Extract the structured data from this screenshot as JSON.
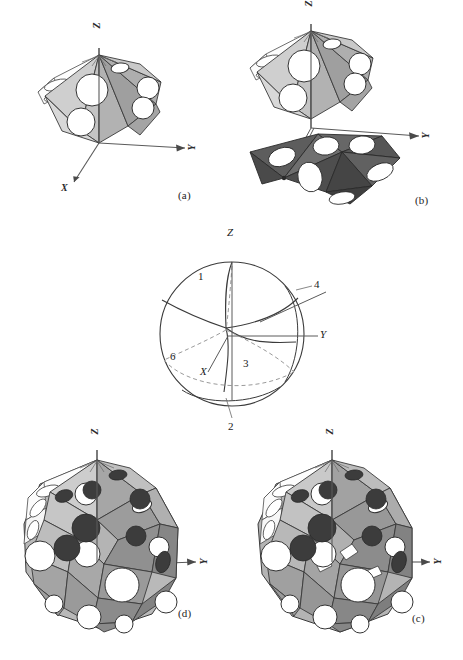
{
  "figure": {
    "type": "scientific-illustration",
    "background_color": "#ffffff",
    "panels": [
      {
        "id": "a",
        "caption": "(a)",
        "description": "single light-gray polyhedral cap cluster with circular pores",
        "axes": [
          {
            "name": "z-axis",
            "label": "Z",
            "direction": "up"
          },
          {
            "name": "y-axis",
            "label": "Y",
            "direction": "right"
          },
          {
            "name": "x-axis",
            "label": "X",
            "direction": "lower-left"
          }
        ]
      },
      {
        "id": "b",
        "caption": "(b)",
        "description": "two polyhedral cap clusters, upper light-gray and lower dark-gray, joined along the z axis",
        "axes": [
          {
            "name": "z-axis",
            "label": "Z",
            "direction": "up"
          },
          {
            "name": "y-axis",
            "label": "Y",
            "direction": "right"
          }
        ]
      },
      {
        "id": "d",
        "caption": "(d)",
        "description": "closed quasi-spherical polyhedron assembled from cap clusters, circular pores on facets",
        "axes": [
          {
            "name": "z-axis",
            "label": "Z",
            "direction": "up"
          },
          {
            "name": "y-axis",
            "label": "Y",
            "direction": "right"
          }
        ]
      },
      {
        "id": "c",
        "caption": "(c)",
        "description": "closed quasi-spherical polyhedron, alternate orientation, circular pores on facets",
        "axes": [
          {
            "name": "z-axis",
            "label": "Z",
            "direction": "up"
          },
          {
            "name": "y-axis",
            "label": "Y",
            "direction": "right"
          }
        ]
      }
    ],
    "sphere_diagram": {
      "name": "stereographic-sphere",
      "description": "sphere partitioned into labeled spherical regions by great-circle arcs with dashed hidden axes",
      "axis_labels": [
        {
          "key": "z",
          "text": "Z"
        },
        {
          "key": "y",
          "text": "Y"
        },
        {
          "key": "x",
          "text": "X"
        }
      ],
      "region_labels": [
        {
          "key": "r1",
          "text": "1"
        },
        {
          "key": "r2",
          "text": "2"
        },
        {
          "key": "r3",
          "text": "3"
        },
        {
          "key": "r4",
          "text": "4"
        },
        {
          "key": "r6",
          "text": "6"
        }
      ]
    },
    "colors": {
      "outline": "#3a3a3a",
      "facet_light": "#d2d2d2",
      "facet_mid": "#a9a9a9",
      "facet_dark": "#6e6e6e",
      "facet_darker": "#4a4a4a",
      "facet_white": "#fdfdfd",
      "pore_white": "#ffffff",
      "pore_dark": "#3c3c3c",
      "axis_line": "#5a5a5a",
      "dashed": "#9a9a9a",
      "text": "#1a1a1a"
    }
  }
}
